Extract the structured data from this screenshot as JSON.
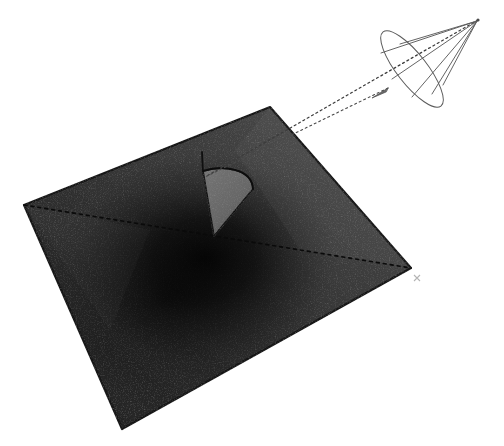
{
  "figure": {
    "title": "Cone intersecting a plane producing a conic section",
    "domain": "diagram",
    "canvas": {
      "width": 504,
      "height": 446,
      "background": "#ffffff"
    },
    "labels": {
      "plane": "plane",
      "cone": "cone",
      "axis": "cone axis",
      "section": "conic section",
      "ellipse": "cone base ellipse",
      "apex": "cone apex",
      "generator": "cone generator line",
      "diagonal": "plane diagonal"
    }
  },
  "colors": {
    "background": "#ffffff",
    "plane_edge": "#1b1b1b",
    "plane_fill_light": "#4b4b4b",
    "plane_fill_mid": "#343434",
    "plane_fill_dark": "#202020",
    "plane_shadow": "#0d0d0d",
    "section_fill": "#6a6a6a",
    "section_fill_dark": "#555555",
    "section_edge": "#141414",
    "wire_stroke": "#5a5a5a",
    "axis_stroke": "#3c3c3c",
    "diagonal_stroke": "#0a0a0a",
    "tick_mark": "#9a9a9a"
  },
  "geometry": {
    "plane": {
      "shape": "quadrilateral",
      "corners": [
        {
          "name": "top",
          "x": 270,
          "y": 107
        },
        {
          "name": "right",
          "x": 411,
          "y": 268
        },
        {
          "name": "bottom",
          "x": 122,
          "y": 429
        },
        {
          "name": "left",
          "x": 24,
          "y": 205
        }
      ],
      "stroke_width": 2.0
    },
    "plane_diagonals": [
      {
        "name": "left-to-right-diagonal",
        "x1": 24,
        "y1": 205,
        "x2": 411,
        "y2": 268,
        "dash": "3 4"
      }
    ],
    "section": {
      "shape": "circular-sector",
      "apex": {
        "x": 203,
        "y": 171
      },
      "bottom": {
        "x": 214,
        "y": 236
      },
      "arc_outer": {
        "x": 253,
        "y": 189
      },
      "arc_control": {
        "x": 252,
        "y": 168
      }
    },
    "section_stem": {
      "x1": 202,
      "y1": 152,
      "x2": 203,
      "y2": 174
    },
    "cone": {
      "apex": {
        "x": 478,
        "y": 20
      },
      "base_center": {
        "x": 388,
        "y": 88
      },
      "base_ellipse": {
        "cx": 412,
        "cy": 69,
        "rx": 15,
        "ry": 47,
        "rotation": -38
      },
      "generators": 5,
      "stroke_width": 0.9
    },
    "axis_line": {
      "x1": 478,
      "y1": 20,
      "x2": 205,
      "y2": 177,
      "dash": "2 3",
      "description": "dashed axis from cone apex through base centre down to the plane section"
    },
    "tick_mark": {
      "x": 416,
      "y": 279,
      "size": 7
    }
  },
  "render": {
    "style": "grayscale raster, dithered shading",
    "shading": "radial darkening toward the centre of the plane beneath the section",
    "line_style": "thin antialiased wireframe with dashed hidden/axis lines"
  }
}
